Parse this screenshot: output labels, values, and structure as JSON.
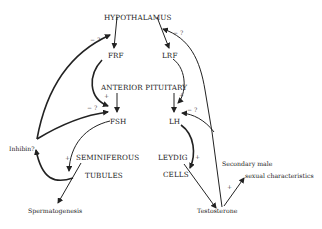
{
  "diagram": {
    "nodes": {
      "hypothalamus": "HYPOTHALAMUS",
      "frf": "FRF",
      "lrf": "LRF",
      "anterior_pituitary": "ANTERIOR PITUITARY",
      "fsh": "FSH",
      "lh": "LH",
      "inhibin": "Inhibin?",
      "seminiferous": "SEMINIFEROUS",
      "tubules": "TUBULES",
      "leydig": "LEYDIG",
      "cells": "CELLS",
      "spermatogenesis": "Spermatogenesis",
      "testosterone": "Testosterone",
      "secondary_1": "Secondary male",
      "secondary_2": "sexual characteristics"
    },
    "signs": {
      "inhibin_to_hyp": "− ?",
      "inhibin_to_fsh": "− ?",
      "frf_to_fsh": "+",
      "lrf_to_lh": "+",
      "testo_to_hyp": "− ?",
      "testo_to_lh": "− ?",
      "fsh_to_tubules": "+",
      "lh_to_leydig": "+",
      "testo_to_secondary": "+"
    }
  }
}
